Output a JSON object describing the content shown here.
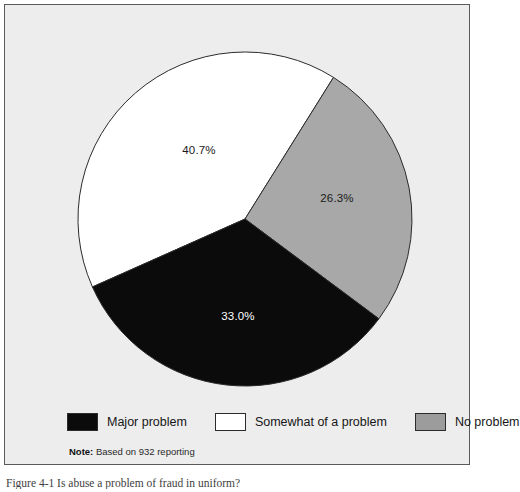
{
  "figure": {
    "note_label": "Note:",
    "note_text": " Based on 932 reporting",
    "caption": "Figure 4-1  Is abuse a problem of fraud in uniform?"
  },
  "legend": {
    "items": [
      {
        "label": "Major problem",
        "swatch": "black",
        "color": "#0b0b0b"
      },
      {
        "label": "Somewhat of a problem",
        "swatch": "white",
        "color": "#ffffff"
      },
      {
        "label": "No problem",
        "swatch": "gray",
        "color": "#9c9c9c"
      }
    ]
  },
  "chart_data": {
    "type": "pie",
    "title": "",
    "subtitle": "",
    "xlabel": "",
    "ylabel": "",
    "grid": false,
    "legend_position": "bottom",
    "note": "Note: Based on 932 reporting",
    "total_responses": 932,
    "units": "percent",
    "start_angle_deg": 32,
    "direction": "clockwise",
    "center": {
      "x": 240,
      "y": 214
    },
    "radius": 167,
    "categories": [
      "Somewhat of a problem",
      "No problem",
      "Major problem"
    ],
    "values": [
      40.7,
      26.3,
      33.0
    ],
    "slices": [
      {
        "label": "Somewhat of a problem",
        "value": 40.7,
        "display": "40.7%",
        "color": "#ffffff",
        "stroke": "#2b2b2b",
        "label_color": "#1a1a1a",
        "start_deg": 246.0,
        "end_deg": 392.0,
        "label_x": 194,
        "label_y": 149
      },
      {
        "label": "No problem",
        "value": 26.3,
        "display": "26.3%",
        "color": "#a8a8a8",
        "stroke": "#2b2b2b",
        "label_color": "#1a1a1a",
        "start_deg": 32.0,
        "end_deg": 126.7,
        "label_x": 332,
        "label_y": 197
      },
      {
        "label": "Major problem",
        "value": 33.0,
        "display": "33.0%",
        "color": "#0b0b0b",
        "stroke": "#2b2b2b",
        "label_color": "#ffffff",
        "start_deg": 126.7,
        "end_deg": 246.0,
        "label_x": 233,
        "label_y": 315
      }
    ]
  },
  "colors": {
    "panel_background": "#ededed",
    "panel_border": "#5a5a5a",
    "page_background": "#ffffff",
    "slice_black": "#0b0b0b",
    "slice_white": "#ffffff",
    "slice_gray": "#a8a8a8",
    "outline": "#2b2b2b",
    "text": "#161616"
  }
}
